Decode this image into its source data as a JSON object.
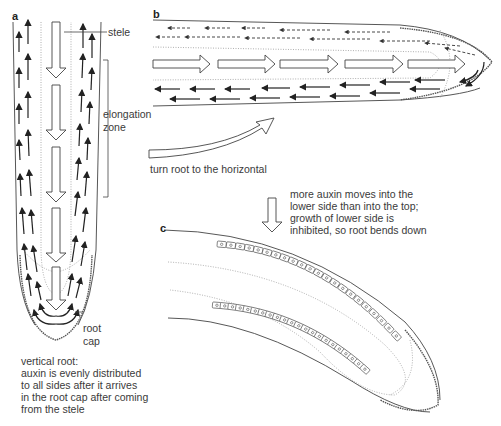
{
  "panels": {
    "a": {
      "letter": "a",
      "labels": {
        "stele": "stele",
        "elongation_zone_line1": "elongation",
        "elongation_zone_line2": "zone",
        "root_cap_line1": "root",
        "root_cap_line2": "cap"
      },
      "caption": [
        "vertical root:",
        "auxin is evenly distributed",
        "to all sides after it arrives",
        "in the root cap after coming",
        "from the stele"
      ]
    },
    "b": {
      "letter": "b",
      "turn_label": "turn root to the horizontal"
    },
    "c": {
      "letter": "c",
      "caption": [
        "more auxin moves into the",
        "lower side than into the top;",
        "growth of lower side is",
        "inhibited, so root bends down"
      ]
    }
  },
  "icons": {
    "stele_flow": "hollow-down-arrow",
    "auxin_flow": "black-up-arrow",
    "gravity": "hollow-down-arrow",
    "turn": "curved-hollow-arrow"
  },
  "colors": {
    "ink": "#333333",
    "background": "#ffffff",
    "dotted_boundary": "#999999"
  }
}
